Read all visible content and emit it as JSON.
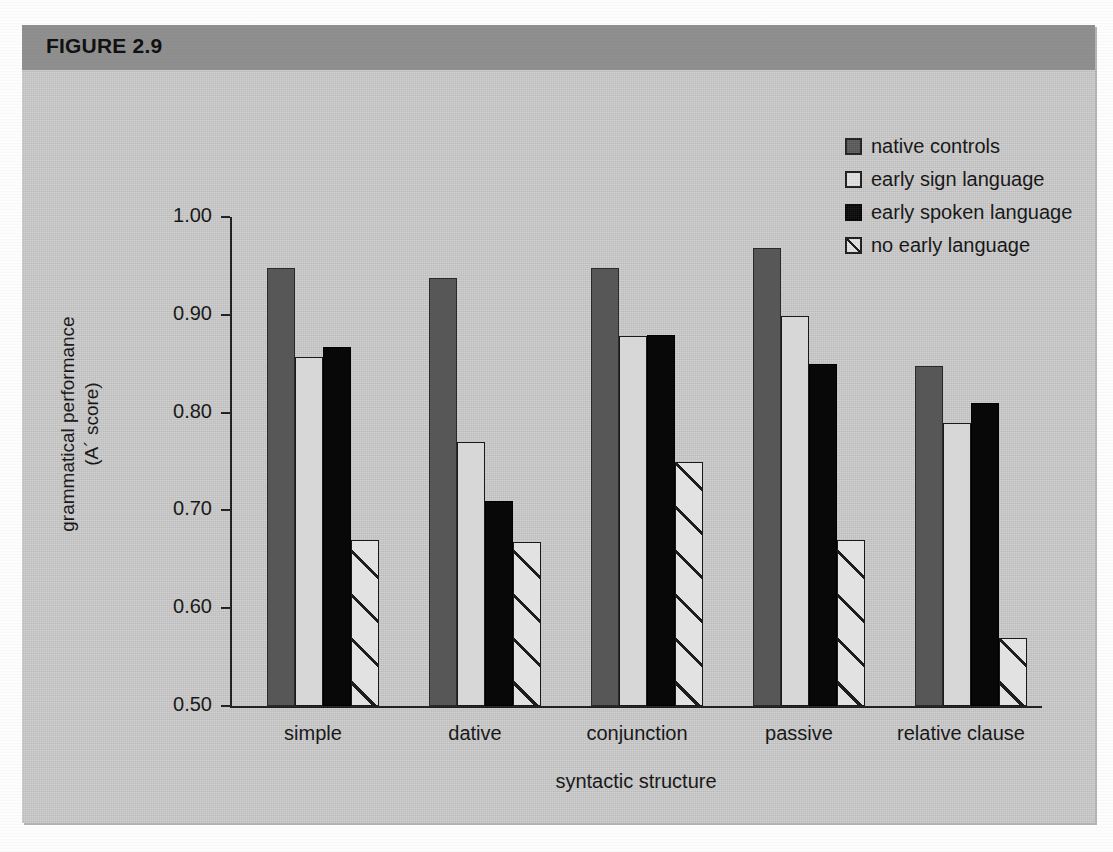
{
  "figure": {
    "label": "FIGURE 2.9",
    "header_color": "#8f8f8f",
    "body_color": "#cdcdcd"
  },
  "legend": {
    "position": "top-right",
    "items": [
      {
        "label": "native controls",
        "swatch": "filled-gray-square-icon",
        "color": "#5b5b5b"
      },
      {
        "label": "early sign language",
        "swatch": "open-white-square-icon",
        "color": "#e6e6e6"
      },
      {
        "label": "early spoken language",
        "swatch": "filled-black-square-icon",
        "color": "#070707"
      },
      {
        "label": "no early language",
        "swatch": "hatched-square-icon",
        "color": "#e6e6e6"
      }
    ]
  },
  "chart_data": {
    "type": "bar",
    "title": "FIGURE 2.9",
    "xlabel": "syntactic structure",
    "ylabel": "grammatical performance\n(A´ score)",
    "ylabel_line1": "grammatical performance",
    "ylabel_line2": "(A´ score)",
    "categories": [
      "simple",
      "dative",
      "conjunction",
      "passive",
      "relative clause"
    ],
    "ylim": [
      0.5,
      1.0
    ],
    "ytick_labels": [
      "1.00",
      "0.90",
      "0.80",
      "0.70",
      "0.60",
      "0.50"
    ],
    "yticks": [
      1.0,
      0.9,
      0.8,
      0.7,
      0.6,
      0.5
    ],
    "grid": false,
    "series": [
      {
        "name": "native controls",
        "values": [
          0.948,
          0.938,
          0.948,
          0.968,
          0.848
        ]
      },
      {
        "name": "early sign language",
        "values": [
          0.857,
          0.77,
          0.878,
          0.899,
          0.789
        ]
      },
      {
        "name": "early spoken language",
        "values": [
          0.867,
          0.71,
          0.879,
          0.85,
          0.81
        ]
      },
      {
        "name": "no early language",
        "values": [
          0.67,
          0.668,
          0.749,
          0.67,
          0.57
        ]
      }
    ]
  }
}
